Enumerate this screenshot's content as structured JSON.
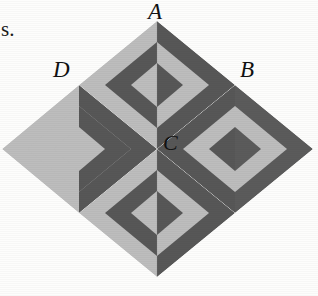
{
  "figure": {
    "kind": "geometric-diagram",
    "background_color": "#fdfdfc",
    "colors": {
      "light_gray": "#b6b6b6",
      "light_gray_alt": "#bdbdbd",
      "dark_gray": "#5b5b5b",
      "dark_gray_alt": "#535353",
      "label_color": "#111111"
    },
    "outer_diamond": {
      "top_vertex": [
        157,
        21
      ],
      "right_vertex": [
        313,
        148
      ],
      "bottom_vertex": [
        157,
        277
      ],
      "left_vertex": [
        2,
        148
      ],
      "center": [
        157,
        149
      ]
    },
    "quadrants": [
      {
        "id": "top",
        "label": "A",
        "center": [
          157,
          85
        ]
      },
      {
        "id": "right",
        "label": "B",
        "center": [
          235,
          149
        ]
      },
      {
        "id": "bottom",
        "label": "",
        "center": [
          157,
          213
        ]
      },
      {
        "id": "left",
        "label": "D",
        "center": [
          79,
          149
        ]
      }
    ],
    "ring_count": 3
  },
  "labels": {
    "a": "A",
    "b": "B",
    "c": "C",
    "d": "D"
  },
  "caption": {
    "fragment": "s."
  }
}
